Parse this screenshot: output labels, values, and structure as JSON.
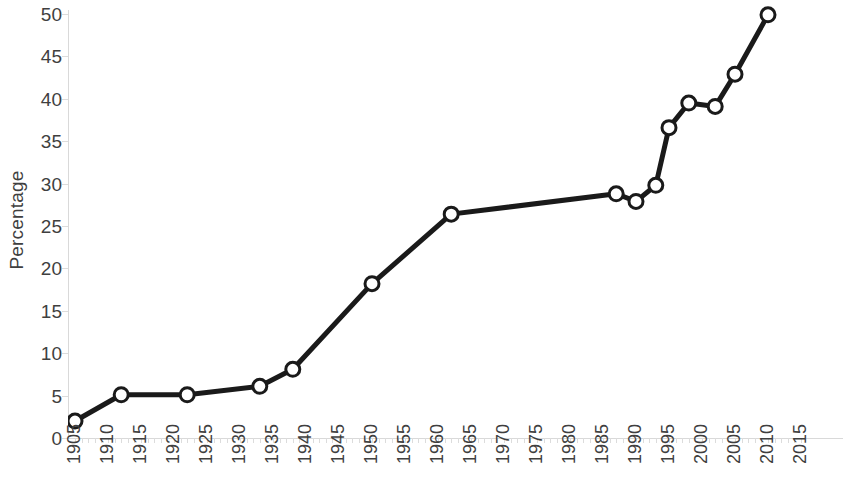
{
  "chart_data": {
    "type": "line",
    "title": "",
    "xlabel": "",
    "ylabel": "Percentage",
    "xlim": [
      1905,
      2015
    ],
    "ylim": [
      0,
      50
    ],
    "y_ticks": [
      0,
      5,
      10,
      15,
      20,
      25,
      30,
      35,
      40,
      45,
      50
    ],
    "x_ticks": [
      1905,
      1910,
      1915,
      1920,
      1925,
      1930,
      1935,
      1940,
      1945,
      1950,
      1955,
      1960,
      1965,
      1970,
      1975,
      1980,
      1985,
      1990,
      1995,
      2000,
      2005,
      2010,
      2015
    ],
    "grid": false,
    "legend": null,
    "series": [
      {
        "name": "Percentage",
        "marker": "circle-open",
        "line_color": "#1a1a1a",
        "marker_face_color": "#ffffff",
        "marker_edge_color": "#1a1a1a",
        "x": [
          1905,
          1912,
          1922,
          1933,
          1938,
          1950,
          1962,
          1987,
          1990,
          1993,
          1995,
          1998,
          2002,
          2005,
          2010
        ],
        "y": [
          2.0,
          5.1,
          5.1,
          6.1,
          8.1,
          18.2,
          26.4,
          28.8,
          27.9,
          29.8,
          36.6,
          39.5,
          39.1,
          42.9,
          49.9
        ]
      }
    ]
  },
  "axis": {
    "y_title": "Percentage",
    "y_tick_labels": [
      "0",
      "5",
      "10",
      "15",
      "20",
      "25",
      "30",
      "35",
      "40",
      "45",
      "50"
    ],
    "x_tick_labels": [
      "1905",
      "1910",
      "1915",
      "1920",
      "1925",
      "1930",
      "1935",
      "1940",
      "1945",
      "1950",
      "1955",
      "1960",
      "1965",
      "1970",
      "1975",
      "1980",
      "1985",
      "1990",
      "1995",
      "2000",
      "2005",
      "2010",
      "2015"
    ]
  },
  "colors": {
    "line": "#1a1a1a",
    "marker_fill": "#ffffff",
    "axis": "#d9d9d9",
    "text": "#3f3f3f",
    "background": "#ffffff"
  }
}
